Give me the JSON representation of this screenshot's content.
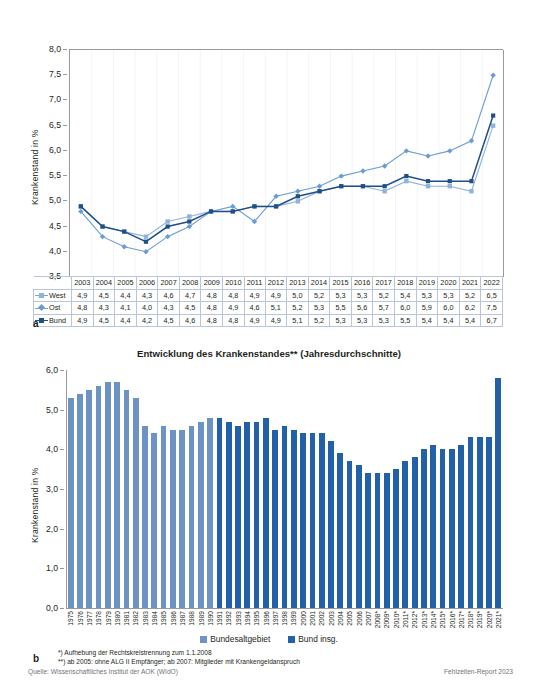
{
  "chart_data": [
    {
      "type": "line",
      "id": "panel-a",
      "panel_letter": "a",
      "title": "",
      "xlabel": "",
      "ylabel": "Krankenstand in %",
      "ylim": [
        3.5,
        8.0
      ],
      "ytick_step": 0.5,
      "yticks": [
        "8,0",
        "7,5",
        "7,0",
        "6,5",
        "6,0",
        "5,5",
        "5,0",
        "4,5",
        "4,0",
        "3,5"
      ],
      "grid": false,
      "categories": [
        "2003",
        "2004",
        "2005",
        "2006",
        "2007",
        "2008",
        "2009",
        "2010",
        "2011",
        "2012",
        "2013",
        "2014",
        "2015",
        "2016",
        "2017",
        "2018",
        "2019",
        "2020",
        "2021",
        "2022"
      ],
      "series": [
        {
          "name": "West",
          "color": "#8fb3da",
          "marker": "square",
          "values": [
            4.9,
            4.5,
            4.4,
            4.3,
            4.6,
            4.7,
            4.8,
            4.8,
            4.9,
            4.9,
            5.0,
            5.2,
            5.3,
            5.3,
            5.2,
            5.4,
            5.3,
            5.3,
            5.2,
            6.5
          ],
          "labels": [
            "4,9",
            "4,5",
            "4,4",
            "4,3",
            "4,6",
            "4,7",
            "4,8",
            "4,8",
            "4,9",
            "4,9",
            "5,0",
            "5,2",
            "5,3",
            "5,3",
            "5,2",
            "5,4",
            "5,3",
            "5,3",
            "5,2",
            "6,5"
          ]
        },
        {
          "name": "Ost",
          "color": "#6b9bd2",
          "marker": "diamond",
          "values": [
            4.8,
            4.3,
            4.1,
            4.0,
            4.3,
            4.5,
            4.8,
            4.9,
            4.6,
            5.1,
            5.2,
            5.3,
            5.5,
            5.6,
            5.7,
            6.0,
            5.9,
            6.0,
            6.2,
            7.5
          ],
          "labels": [
            "4,8",
            "4,3",
            "4,1",
            "4,0",
            "4,3",
            "4,5",
            "4,8",
            "4,9",
            "4,6",
            "5,1",
            "5,2",
            "5,3",
            "5,5",
            "5,6",
            "5,7",
            "6,0",
            "5,9",
            "6,0",
            "6,2",
            "7,5"
          ]
        },
        {
          "name": "Bund",
          "color": "#1f4e88",
          "marker": "square",
          "values": [
            4.9,
            4.5,
            4.4,
            4.2,
            4.5,
            4.6,
            4.8,
            4.8,
            4.9,
            4.9,
            5.1,
            5.2,
            5.3,
            5.3,
            5.3,
            5.5,
            5.4,
            5.4,
            5.4,
            6.7
          ],
          "labels": [
            "4,9",
            "4,5",
            "4,4",
            "4,2",
            "4,5",
            "4,6",
            "4,8",
            "4,8",
            "4,9",
            "4,9",
            "5,1",
            "5,2",
            "5,3",
            "5,3",
            "5,3",
            "5,5",
            "5,4",
            "5,4",
            "5,4",
            "6,7"
          ]
        }
      ]
    },
    {
      "type": "bar",
      "id": "panel-b",
      "panel_letter": "b",
      "title": "Entwicklung des Krankenstandes** (Jahresdurchschnitte)",
      "xlabel": "",
      "ylabel": "Krankenstand in %",
      "ylim": [
        0.0,
        6.0
      ],
      "ytick_step": 1.0,
      "yticks": [
        "6,0",
        "5,0",
        "4,0",
        "3,0",
        "2,0",
        "1,0",
        "0,0"
      ],
      "grid": false,
      "legend_position": "bottom",
      "legend": [
        {
          "label": "Bundesaltgebiet",
          "color": "#6d93c4"
        },
        {
          "label": "Bund insg.",
          "color": "#2260a8"
        }
      ],
      "categories": [
        "1975",
        "1976",
        "1977",
        "1978",
        "1979",
        "1980",
        "1981",
        "1982",
        "1983",
        "1984",
        "1985",
        "1986",
        "1987",
        "1988",
        "1989",
        "1990",
        "1991",
        "1992",
        "1993",
        "1994",
        "1995",
        "1996",
        "1997",
        "1998",
        "1999",
        "2000",
        "2001",
        "2002",
        "2003",
        "2004",
        "2005",
        "2006",
        "2007",
        "2008*",
        "2009*",
        "2010*",
        "2011*",
        "2012*",
        "2013*",
        "2014*",
        "2015*",
        "2016*",
        "2017*",
        "2018*",
        "2019*",
        "2020*",
        "2021*"
      ],
      "series": [
        {
          "name": "Bundesaltgebiet",
          "color": "#6d93c4",
          "values": [
            5.3,
            5.4,
            5.5,
            5.6,
            5.7,
            5.7,
            5.5,
            5.3,
            4.6,
            4.4,
            4.6,
            4.5,
            4.5,
            4.6,
            4.7,
            4.8,
            5.0,
            5.1,
            5.2,
            null,
            null,
            null,
            null,
            null,
            null,
            null,
            null,
            null,
            null,
            null,
            null,
            null,
            null,
            null,
            null,
            null,
            null,
            null,
            null,
            null,
            null,
            null,
            null,
            null,
            null,
            null,
            null
          ]
        },
        {
          "name": "Bund insg.",
          "color": "#2260a8",
          "values": [
            null,
            null,
            null,
            null,
            null,
            null,
            null,
            null,
            null,
            null,
            null,
            null,
            null,
            null,
            null,
            null,
            4.8,
            4.7,
            4.6,
            4.7,
            4.7,
            4.8,
            4.5,
            4.6,
            4.5,
            4.4,
            4.4,
            4.4,
            4.2,
            3.9,
            3.7,
            3.6,
            3.4,
            3.4,
            3.4,
            3.5,
            3.7,
            3.8,
            4.0,
            4.1,
            4.0,
            4.0,
            4.1,
            4.3,
            4.3,
            4.3,
            5.8
          ]
        }
      ],
      "footnotes": [
        "*) Aufhebung der Rechtskreistrennung zum 1.1.2008",
        "**) ab 2005: ohne ALG II Empfänger; ab 2007: Mitglieder mit Krankengeldanspruch"
      ]
    }
  ],
  "panel_a": {
    "ylabel": "Krankenstand in %",
    "letter": "a",
    "table": {
      "col_headers": [
        "2003",
        "2004",
        "2005",
        "2006",
        "2007",
        "2008",
        "2009",
        "2010",
        "2011",
        "2012",
        "2013",
        "2014",
        "2015",
        "2016",
        "2017",
        "2018",
        "2019",
        "2020",
        "2021",
        "2022"
      ],
      "rows": [
        {
          "label": "West",
          "marker": "square-light",
          "color": "#8fb3da",
          "values": [
            "4,9",
            "4,5",
            "4,4",
            "4,3",
            "4,6",
            "4,7",
            "4,8",
            "4,8",
            "4,9",
            "4,9",
            "5,0",
            "5,2",
            "5,3",
            "5,3",
            "5,2",
            "5,4",
            "5,3",
            "5,3",
            "5,2",
            "6,5"
          ]
        },
        {
          "label": "Ost",
          "marker": "diamond-light",
          "color": "#6b9bd2",
          "values": [
            "4,8",
            "4,3",
            "4,1",
            "4,0",
            "4,3",
            "4,5",
            "4,8",
            "4,9",
            "4,6",
            "5,1",
            "5,2",
            "5,3",
            "5,5",
            "5,6",
            "5,7",
            "6,0",
            "5,9",
            "6,0",
            "6,2",
            "7,5"
          ]
        },
        {
          "label": "Bund",
          "marker": "square-dark",
          "color": "#1f4e88",
          "values": [
            "4,9",
            "4,5",
            "4,4",
            "4,2",
            "4,5",
            "4,6",
            "4,8",
            "4,8",
            "4,9",
            "4,9",
            "5,1",
            "5,2",
            "5,3",
            "5,3",
            "5,3",
            "5,5",
            "5,4",
            "5,4",
            "5,4",
            "6,7"
          ]
        }
      ]
    }
  },
  "panel_b": {
    "title": "Entwicklung des Krankenstandes** (Jahresdurchschnitte)",
    "ylabel": "Krankenstand in %",
    "letter": "b",
    "legend": [
      "Bundesaltgebiet",
      "Bund insg."
    ],
    "footnote1": "*) Aufhebung der Rechtskreistrennung zum 1.1.2008",
    "footnote2": "**) ab 2005: ohne ALG II Empfänger; ab 2007: Mitglieder mit Krankengeldanspruch"
  },
  "footer": {
    "source": "Quelle: Wissenschaftliches Institut der AOK (WIdO)",
    "report": "Fehlzeiten-Report 2023"
  },
  "colors": {
    "west": "#8fb3da",
    "ost": "#6b9bd2",
    "bund": "#1f4e88",
    "bar_light": "#6d93c4",
    "bar_dark": "#2260a8",
    "axis": "#9a9a9a",
    "table_border": "#b9c6da",
    "footer_text": "#6f7479"
  }
}
